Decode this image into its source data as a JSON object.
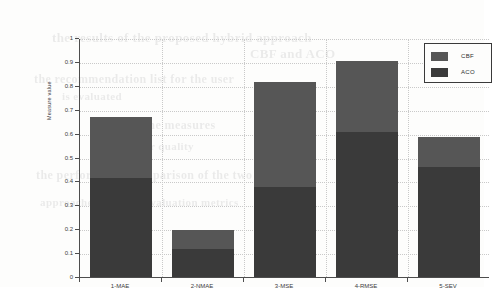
{
  "chart_data": {
    "type": "bar",
    "subtype": "stacked-vertical",
    "title": "",
    "xlabel": "",
    "ylabel": "Measure value",
    "categories": [
      "1-MAE",
      "2-NMAE",
      "3-MSE",
      "4-RMSE",
      "5-SEV"
    ],
    "series": [
      {
        "name": "ACO",
        "color": "#3a3a3a",
        "values": [
          0.415,
          0.118,
          0.375,
          0.605,
          0.46
        ]
      },
      {
        "name": "CBF",
        "color": "#565656",
        "values": [
          0.255,
          0.077,
          0.44,
          0.3,
          0.125
        ]
      }
    ],
    "totals": [
      0.67,
      0.195,
      0.815,
      0.905,
      0.585
    ],
    "ylim": [
      0,
      1
    ],
    "yticks": [
      "0",
      "0.1",
      "0.2",
      "0.3",
      "0.4",
      "0.5",
      "0.6",
      "0.7",
      "0.8",
      "0.9",
      "1"
    ],
    "ytick_values": [
      0,
      0.1,
      0.2,
      0.3,
      0.4,
      0.5,
      0.6,
      0.7,
      0.8,
      0.9,
      1
    ],
    "grid": true,
    "grid_axis": "both",
    "legend": {
      "position": "top-right",
      "entries": [
        {
          "label": "CBF",
          "color": "#565656"
        },
        {
          "label": "ACO",
          "color": "#3a3a3a"
        }
      ]
    }
  },
  "page": {
    "background": "#fdfdfc",
    "axis_color": "#4d4d4d",
    "grid_color": "#c9c9c9",
    "bleed_text": [
      {
        "text": "the results of the proposed hybrid approach",
        "x": 52,
        "y": 30,
        "size": 13
      },
      {
        "text": "CBF and ACO",
        "x": 250,
        "y": 46,
        "size": 13
      },
      {
        "text": "the recommendation list for the user",
        "x": 34,
        "y": 72,
        "size": 12
      },
      {
        "text": "is evaluated",
        "x": 62,
        "y": 90,
        "size": 11
      },
      {
        "text": "and the measures",
        "x": 120,
        "y": 118,
        "size": 12
      },
      {
        "text": "for quality",
        "x": 140,
        "y": 140,
        "size": 11
      },
      {
        "text": "the performance comparison of the two",
        "x": 36,
        "y": 168,
        "size": 12
      },
      {
        "text": "approaches over the evaluation metrics",
        "x": 40,
        "y": 196,
        "size": 11
      }
    ]
  }
}
